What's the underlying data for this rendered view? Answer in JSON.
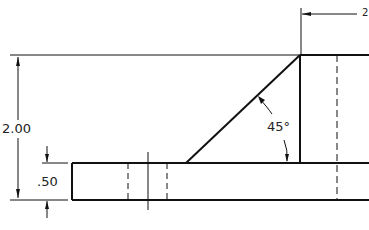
{
  "drawing": {
    "dimensions": {
      "overall_height": "2.00",
      "base_thickness": ".50",
      "angle": "45°",
      "top_partial": "2"
    },
    "colors": {
      "line": "#111111",
      "background": "#ffffff"
    }
  }
}
